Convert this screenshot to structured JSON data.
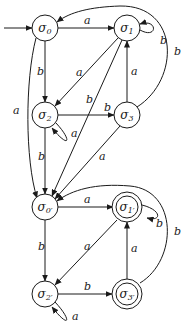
{
  "diagram": {
    "type": "finite-automaton",
    "start_state": "σ0",
    "states": [
      {
        "id": "s0",
        "label": "σ0",
        "accepting": false
      },
      {
        "id": "s1",
        "label": "σ1",
        "accepting": false
      },
      {
        "id": "s2",
        "label": "σ2",
        "accepting": false
      },
      {
        "id": "s3",
        "label": "σ3",
        "accepting": false
      },
      {
        "id": "s0p",
        "label": "σ0′",
        "accepting": false
      },
      {
        "id": "s1p",
        "label": "σ1′",
        "accepting": true
      },
      {
        "id": "s2p",
        "label": "σ2′",
        "accepting": false
      },
      {
        "id": "s3p",
        "label": "σ3′",
        "accepting": true
      }
    ],
    "transitions": [
      {
        "from": "σ0",
        "to": "σ1",
        "label": "a"
      },
      {
        "from": "σ0",
        "to": "σ2",
        "label": "b"
      },
      {
        "from": "σ0",
        "to": "σ0′",
        "label": "a"
      },
      {
        "from": "σ1",
        "to": "σ1",
        "label": "b"
      },
      {
        "from": "σ1",
        "to": "σ2",
        "label": "a"
      },
      {
        "from": "σ1",
        "to": "σ0′",
        "label": "b"
      },
      {
        "from": "σ2",
        "to": "σ3",
        "label": "b"
      },
      {
        "from": "σ2",
        "to": "σ2",
        "label": "a"
      },
      {
        "from": "σ2",
        "to": "σ0′",
        "label": "b"
      },
      {
        "from": "σ3",
        "to": "σ1",
        "label": "a"
      },
      {
        "from": "σ3",
        "to": "σ0",
        "label": "b"
      },
      {
        "from": "σ3",
        "to": "σ0′",
        "label": "a"
      },
      {
        "from": "σ0′",
        "to": "σ1′",
        "label": "a"
      },
      {
        "from": "σ0′",
        "to": "σ2′",
        "label": "b"
      },
      {
        "from": "σ1′",
        "to": "σ1′",
        "label": "b"
      },
      {
        "from": "σ1′",
        "to": "σ2′",
        "label": "a"
      },
      {
        "from": "σ2′",
        "to": "σ3′",
        "label": "b"
      },
      {
        "from": "σ2′",
        "to": "σ2′",
        "label": "a"
      },
      {
        "from": "σ3′",
        "to": "σ1′",
        "label": "a"
      },
      {
        "from": "σ3′",
        "to": "σ0′",
        "label": "b"
      }
    ],
    "edge_labels": {
      "s0_s1": "a",
      "s0_s2": "b",
      "s0_s0p": "a",
      "s1_loop": "b",
      "s1_s2": "a",
      "s1_s0p": "b",
      "s2_s3": "b",
      "s2_loop": "a",
      "s2_s0p": "b",
      "s3_s1": "a",
      "s3_s0": "b",
      "s3_s0p": "a",
      "s0p_s1p": "a",
      "s0p_s2p": "b",
      "s1p_loop": "b",
      "s1p_s2p": "a",
      "s2p_s3p": "b",
      "s2p_loop": "a",
      "s3p_s1p": "a",
      "s3p_s0p": "b"
    },
    "node_labels": {
      "s0": "σ",
      "s0_sub": "0",
      "s1": "σ",
      "s1_sub": "1",
      "s2": "σ",
      "s2_sub": "2",
      "s3": "σ",
      "s3_sub": "3",
      "s0p": "σ",
      "s0p_sub": "0′",
      "s1p": "σ",
      "s1p_sub": "1′",
      "s2p": "σ",
      "s2p_sub": "2′",
      "s3p": "σ",
      "s3p_sub": "3′"
    }
  }
}
